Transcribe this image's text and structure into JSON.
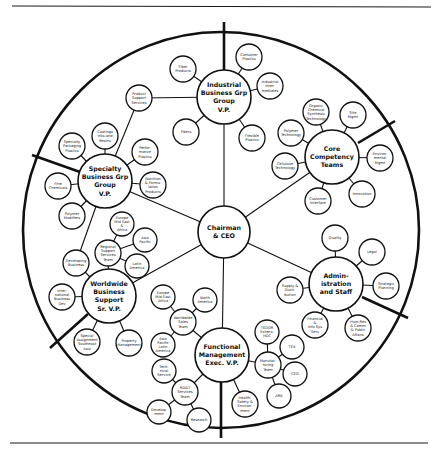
{
  "diagram": {
    "type": "circular-organization-chart",
    "center": {
      "id": "ceo",
      "lines": [
        "Chairman",
        "& CEO"
      ],
      "x": 224,
      "y": 232,
      "r": 26
    },
    "outer_ring": {
      "cx": 221,
      "cy": 230,
      "r": 198
    },
    "dividers": [
      {
        "x1": 224,
        "y1": 22,
        "x2": 224,
        "y2": 72
      },
      {
        "x1": 395,
        "y1": 121,
        "x2": 358,
        "y2": 143
      },
      {
        "x1": 408,
        "y1": 318,
        "x2": 362,
        "y2": 297
      },
      {
        "x1": 221,
        "y1": 438,
        "x2": 221,
        "y2": 381
      },
      {
        "x1": 50,
        "y1": 348,
        "x2": 88,
        "y2": 314
      },
      {
        "x1": 32,
        "y1": 155,
        "x2": 80,
        "y2": 172
      }
    ],
    "divisions": [
      {
        "id": "industrial",
        "lines": [
          "Industrial",
          "Business Grp",
          "Group",
          "V.P."
        ],
        "x": 224,
        "y": 97,
        "r": 27,
        "children": [
          {
            "lines": [
              "Fiber",
              "Products"
            ],
            "x": 183,
            "y": 69,
            "r": 13
          },
          {
            "lines": [
              "Container",
              "Plastics"
            ],
            "x": 249,
            "y": 57,
            "r": 13
          },
          {
            "lines": [
              "Industrial",
              "Inter-",
              "mediates"
            ],
            "x": 270,
            "y": 86,
            "r": 13
          },
          {
            "lines": [
              "Flexible",
              "Plastics"
            ],
            "x": 252,
            "y": 138,
            "r": 13
          },
          {
            "lines": [
              "Fibers"
            ],
            "x": 186,
            "y": 132,
            "r": 13
          }
        ]
      },
      {
        "id": "core",
        "lines": [
          "Core",
          "Competency",
          "Teams"
        ],
        "x": 332,
        "y": 157,
        "r": 27,
        "children": [
          {
            "lines": [
              "Organic",
              "Chemical",
              "Synthesis",
              "Technology"
            ],
            "x": 316,
            "y": 112,
            "r": 13
          },
          {
            "lines": [
              "Site",
              "Mgmt"
            ],
            "x": 353,
            "y": 115,
            "r": 13
          },
          {
            "lines": [
              "Polymer",
              "Technology"
            ],
            "x": 291,
            "y": 133,
            "r": 13
          },
          {
            "lines": [
              "Environ-",
              "mental",
              "Mgmt"
            ],
            "x": 380,
            "y": 158,
            "r": 13
          },
          {
            "lines": [
              "Cellulose",
              "Technology"
            ],
            "x": 285,
            "y": 166,
            "r": 13
          },
          {
            "lines": [
              "Innovation"
            ],
            "x": 362,
            "y": 194,
            "r": 13
          },
          {
            "lines": [
              "Customer",
              "Interface"
            ],
            "x": 318,
            "y": 201,
            "r": 13
          }
        ]
      },
      {
        "id": "admin",
        "lines": [
          "Admin-",
          "istration",
          "and Staff"
        ],
        "x": 336,
        "y": 284,
        "r": 27,
        "children": [
          {
            "lines": [
              "Quality"
            ],
            "x": 335,
            "y": 238,
            "r": 13
          },
          {
            "lines": [
              "Legal"
            ],
            "x": 372,
            "y": 252,
            "r": 13
          },
          {
            "lines": [
              "Strategic",
              "Planning"
            ],
            "x": 386,
            "y": 286,
            "r": 13
          },
          {
            "lines": [
              "Supply &",
              "Distri-",
              "bution"
            ],
            "x": 290,
            "y": 290,
            "r": 13
          },
          {
            "lines": [
              "Financial",
              "&",
              "Info Sys",
              "Serv"
            ],
            "x": 315,
            "y": 325,
            "r": 13
          },
          {
            "lines": [
              "Hum Res",
              "& Comm",
              "& Public",
              "Affairs"
            ],
            "x": 358,
            "y": 328,
            "r": 13
          }
        ]
      },
      {
        "id": "functional",
        "lines": [
          "Functional",
          "Management",
          "Exec. V.P."
        ],
        "x": 222,
        "y": 355,
        "r": 27,
        "children": [
          {
            "lines": [
              "Health,",
              "Safety &",
              "Environ-",
              "ment"
            ],
            "x": 245,
            "y": 404,
            "r": 13
          },
          {
            "lines": [
              "Manufac-",
              "turing",
              "Team"
            ],
            "x": 268,
            "y": 365,
            "r": 13,
            "id": "manufacturing",
            "children": [
              {
                "lines": [
                  "TEDOR",
                  "Extens.",
                  "HDC"
                ],
                "x": 267,
                "y": 332,
                "r": 12
              },
              {
                "lines": [
                  "TEX"
                ],
                "x": 292,
                "y": 347,
                "r": 12
              },
              {
                "lines": [
                  "CEO"
                ],
                "x": 295,
                "y": 374,
                "r": 12
              },
              {
                "lines": [
                  "ARK"
                ],
                "x": 279,
                "y": 396,
                "r": 12
              }
            ]
          },
          {
            "lines": [
              "Worldwide",
              "Sales",
              "Team"
            ],
            "x": 183,
            "y": 322,
            "r": 13,
            "id": "worldwide-sales",
            "children": [
              {
                "lines": [
                  "Europe",
                  "Mid East",
                  "Africa"
                ],
                "x": 163,
                "y": 297,
                "r": 12
              },
              {
                "lines": [
                  "North",
                  "America"
                ],
                "x": 205,
                "y": 300,
                "r": 12
              },
              {
                "lines": [
                  "Asia",
                  "Pacific",
                  "Latin",
                  "America"
                ],
                "x": 163,
                "y": 345,
                "r": 12
              }
            ]
          },
          {
            "lines": [
              "RD&T",
              "Services",
              "Team"
            ],
            "x": 185,
            "y": 392,
            "r": 13,
            "id": "rdt",
            "children": [
              {
                "lines": [
                  "Tech-",
                  "nical",
                  "Service"
                ],
                "x": 164,
                "y": 371,
                "r": 12
              },
              {
                "lines": [
                  "Develop-",
                  "ment"
                ],
                "x": 159,
                "y": 412,
                "r": 12
              },
              {
                "lines": [
                  "Research"
                ],
                "x": 199,
                "y": 420,
                "r": 12
              }
            ]
          }
        ]
      },
      {
        "id": "worldwide",
        "lines": [
          "Worldwide",
          "Business",
          "Support",
          "Sr. V.P."
        ],
        "x": 109,
        "y": 296,
        "r": 27,
        "children": [
          {
            "lines": [
              "Inter-",
              "national",
              "Business",
              "Dev"
            ],
            "x": 62,
            "y": 297,
            "r": 13
          },
          {
            "lines": [
              "Developing",
              "Business"
            ],
            "x": 76,
            "y": 263,
            "r": 13
          },
          {
            "lines": [
              "Special",
              "Assignment",
              "Southeast",
              "Asia"
            ],
            "x": 87,
            "y": 342,
            "r": 13
          },
          {
            "lines": [
              "Property",
              "Management"
            ],
            "x": 129,
            "y": 343,
            "r": 13
          },
          {
            "lines": [
              "Regional",
              "Support",
              "Services",
              "Team"
            ],
            "x": 108,
            "y": 253,
            "r": 13,
            "id": "regional",
            "children": [
              {
                "lines": [
                  "Europe",
                  "Mid East",
                  "&",
                  "Africa"
                ],
                "x": 122,
                "y": 224,
                "r": 12
              },
              {
                "lines": [
                  "Asia",
                  "Pacific"
                ],
                "x": 145,
                "y": 240,
                "r": 12
              },
              {
                "lines": [
                  "Latin",
                  "America"
                ],
                "x": 137,
                "y": 266,
                "r": 12
              }
            ]
          }
        ]
      },
      {
        "id": "specialty",
        "lines": [
          "Specialty",
          "Business Grp",
          "Group",
          "V.P."
        ],
        "x": 105,
        "y": 181,
        "r": 27,
        "children": [
          {
            "lines": [
              "Product",
              "Support",
              "Services"
            ],
            "x": 139,
            "y": 98,
            "r": 13
          },
          {
            "lines": [
              "Coatings",
              "Inks and",
              "Resins"
            ],
            "x": 105,
            "y": 136,
            "r": 13
          },
          {
            "lines": [
              "Specialty",
              "Packaging",
              "Plastics"
            ],
            "x": 72,
            "y": 146,
            "r": 13
          },
          {
            "lines": [
              "Perfor-",
              "mance",
              "Plastics"
            ],
            "x": 145,
            "y": 152,
            "r": 13
          },
          {
            "lines": [
              "Fine",
              "Chemicals"
            ],
            "x": 58,
            "y": 186,
            "r": 13
          },
          {
            "lines": [
              "Nutrition",
              "& Formu-",
              "lation",
              "Products"
            ],
            "x": 153,
            "y": 185,
            "r": 13
          },
          {
            "lines": [
              "Polymer",
              "Modifiers"
            ],
            "x": 72,
            "y": 216,
            "r": 13
          }
        ]
      }
    ],
    "extra_links": [
      {
        "from": "industrial",
        "to_xy": [
          139,
          98
        ]
      },
      {
        "from": "specialty",
        "to_xy": [
          76,
          263
        ],
        "via": "developing"
      }
    ]
  }
}
